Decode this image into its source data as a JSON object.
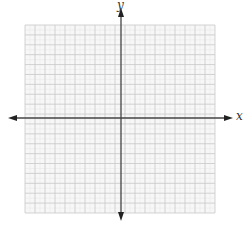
{
  "diagram": {
    "type": "coordinate-plane",
    "axes": {
      "x_label": "x",
      "y_label": "y",
      "axis_color": "#444444",
      "arrows": "both-ends"
    },
    "grid": {
      "columns": 19,
      "rows": 19,
      "line_color": "#c8c8c8",
      "minor_line_color": "#e6e6e6",
      "background": "#f7f7f7"
    }
  }
}
